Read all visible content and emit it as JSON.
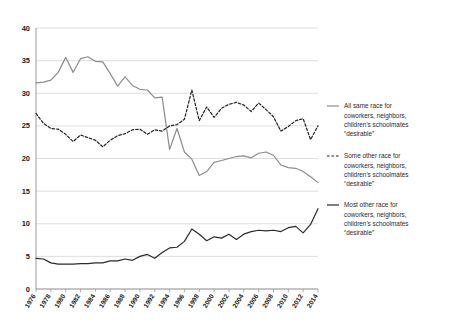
{
  "chart_data": {
    "type": "line",
    "title": "",
    "subtitle": "",
    "xlabel": "",
    "ylabel": "",
    "xlim": [
      1976,
      2014
    ],
    "ylim": [
      0,
      40
    ],
    "yticks": [
      0,
      5,
      10,
      15,
      20,
      25,
      30,
      35,
      40
    ],
    "ytick_labels": [
      "0",
      "5",
      "10",
      "15",
      "20",
      "25",
      "30",
      "35",
      "40"
    ],
    "grid": "horizontal",
    "legend_position": "right",
    "x": [
      1976,
      1977,
      1978,
      1979,
      1980,
      1981,
      1982,
      1983,
      1984,
      1985,
      1986,
      1987,
      1988,
      1989,
      1990,
      1991,
      1992,
      1993,
      1994,
      1995,
      1996,
      1997,
      1998,
      1999,
      2000,
      2001,
      2002,
      2003,
      2004,
      2005,
      2006,
      2007,
      2008,
      2009,
      2010,
      2011,
      2012,
      2013,
      2014
    ],
    "xticks": [
      1976,
      1978,
      1980,
      1982,
      1984,
      1986,
      1988,
      1990,
      1992,
      1994,
      1996,
      1998,
      2000,
      2002,
      2004,
      2006,
      2008,
      2010,
      2012,
      2014
    ],
    "xtick_labels": [
      "1976",
      "1978",
      "1980",
      "1982",
      "1984",
      "1986",
      "1988",
      "1990",
      "1992",
      "1994",
      "1996",
      "1998",
      "2000",
      "2002",
      "2004",
      "2006",
      "2008",
      "2010",
      "2012",
      "2014"
    ],
    "series": [
      {
        "name": "All same race for coworkers, neighbors, children's schoolmates \"desirable\"",
        "legend_label": "All same race for\ncoworkers, neighbors,\nchildren's schoolmates\n\"desirable\"",
        "style": "solid",
        "color": "#8d8d8d",
        "width": 1.2,
        "values": [
          31.6,
          31.7,
          32.0,
          33.2,
          35.5,
          33.2,
          35.3,
          35.6,
          34.9,
          34.8,
          33.0,
          31.1,
          32.5,
          31.2,
          30.6,
          30.5,
          29.3,
          29.4,
          21.4,
          24.6,
          21.0,
          19.9,
          17.4,
          18.0,
          19.4,
          19.7,
          20.0,
          20.3,
          20.4,
          20.1,
          20.8,
          21.0,
          20.5,
          19.0,
          18.6,
          18.5,
          18.0,
          17.2,
          16.3
        ]
      },
      {
        "name": "Some other race for coworkers, neighbors, children's schoolmates \"desirable\"",
        "legend_label": "Some other race for\ncoworkers, neighbors,\nchildren's schoolmates\n\"desirable\"",
        "style": "dashed",
        "color": "#222222",
        "width": 1.2,
        "values": [
          26.9,
          25.4,
          24.6,
          24.5,
          23.7,
          22.6,
          23.6,
          23.2,
          22.8,
          21.8,
          22.8,
          23.5,
          23.8,
          24.4,
          24.5,
          23.7,
          24.4,
          24.2,
          25.0,
          25.2,
          26.0,
          30.5,
          25.8,
          27.9,
          26.3,
          27.7,
          28.3,
          28.6,
          28.2,
          27.2,
          28.5,
          27.5,
          26.4,
          24.2,
          24.9,
          25.8,
          26.1,
          22.9,
          25.0
        ]
      },
      {
        "name": "Most other race for coworkers, neighbors, children's schoolmates \"desirable\"",
        "legend_label": "Most other race for\ncoworkers, neighbors,\nchildren's schoolmates\n\"desirable\"",
        "style": "solid",
        "color": "#2b2b2b",
        "width": 1.2,
        "values": [
          4.7,
          4.6,
          4.0,
          3.8,
          3.8,
          3.8,
          3.9,
          3.9,
          4.0,
          4.0,
          4.3,
          4.3,
          4.6,
          4.4,
          5.0,
          5.3,
          4.7,
          5.6,
          6.3,
          6.4,
          7.3,
          9.2,
          8.4,
          7.4,
          8.0,
          7.8,
          8.4,
          7.6,
          8.4,
          8.8,
          9.0,
          8.9,
          9.0,
          8.8,
          9.4,
          9.6,
          8.6,
          9.9,
          12.3
        ]
      }
    ]
  },
  "legend": {
    "items": [
      {
        "marker": "solid-gray-line",
        "lines": [
          "All same race for",
          "coworkers, neighbors,",
          "children's schoolmates",
          "“desirable”"
        ]
      },
      {
        "marker": "dashed-black-line",
        "lines": [
          "Some other race for",
          "coworkers, neighbors,",
          "children's schoolmates",
          "“desirable”"
        ]
      },
      {
        "marker": "solid-dark-line",
        "lines": [
          "Most other race for",
          "coworkers, neighbors,",
          "children's schoolmates",
          "“desirable”"
        ]
      }
    ]
  },
  "colors": {
    "series_all_same": "#8d8d8d",
    "series_some_other": "#222222",
    "series_most_other": "#2b2b2b",
    "grid": "#d6d6d6",
    "axis": "#9a9a9a",
    "text": "#1b1b1b",
    "background": "#ffffff"
  }
}
